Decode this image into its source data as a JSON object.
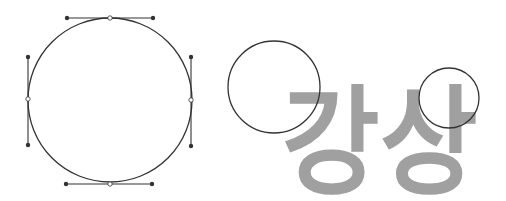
{
  "diagram": {
    "colors": {
      "stroke": "#333333",
      "handle_point": "#333333",
      "anchor_fill": "#ffffff",
      "text": "#a0a0a0",
      "background": "#ffffff"
    },
    "bezier_circle": {
      "cx": 110,
      "cy": 100,
      "r": 82,
      "anchors": [
        {
          "name": "top",
          "x": 110,
          "y": 18,
          "handles": [
            [
              67,
              18
            ],
            [
              153,
              18
            ]
          ]
        },
        {
          "name": "right",
          "x": 191,
          "y": 100,
          "handles": [
            [
              191,
              57
            ],
            [
              191,
              146
            ]
          ]
        },
        {
          "name": "bottom",
          "x": 110,
          "y": 184,
          "handles": [
            [
              66,
              184
            ],
            [
              152,
              184
            ]
          ]
        },
        {
          "name": "left",
          "x": 28,
          "y": 99,
          "handles": [
            [
              28,
              57
            ],
            [
              28,
              145
            ]
          ]
        }
      ]
    },
    "overlay_circles": [
      {
        "cx": 274,
        "cy": 87,
        "r": 46
      },
      {
        "cx": 449,
        "cy": 98,
        "r": 30
      }
    ],
    "text": {
      "label": "강상",
      "x": 282,
      "y": 184,
      "font_size": 118
    }
  }
}
